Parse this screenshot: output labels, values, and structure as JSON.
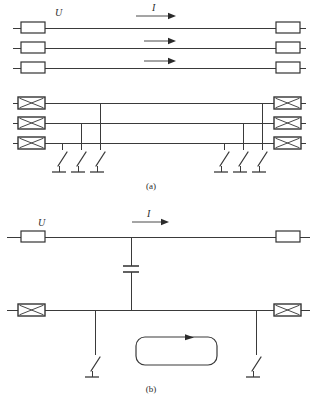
{
  "figure": {
    "labels": {
      "voltage": "U",
      "current": "I"
    },
    "captions": {
      "top": "(a)",
      "bottom": "(b)"
    }
  },
  "panel_a": {
    "caption": "(a)",
    "voltage_label": "U",
    "current_label": "I",
    "upper_section": {
      "description": "three parallel conductors with rectangular terminal boxes at both ends",
      "line_count": 3,
      "current_arrow_count": 3,
      "left_terminal_name": "plain-rectangle-terminal",
      "right_terminal_name": "plain-rectangle-terminal"
    },
    "lower_section": {
      "description": "three parallel buses with crossed-box terminals and earthing switches",
      "line_count": 3,
      "left_terminal_name": "crossed-box-terminal",
      "right_terminal_name": "crossed-box-terminal",
      "left_switch_count": 3,
      "right_switch_count": 3,
      "switch_name": "earthing-switch"
    }
  },
  "panel_b": {
    "caption": "(b)",
    "voltage_label": "U",
    "current_label": "I",
    "upper_line_terminal_name": "plain-rectangle-terminal",
    "lower_line_terminal_name": "crossed-box-terminal",
    "capacitor_name": "capacitor-symbol",
    "loop_name": "current-loop",
    "loop_arrow_direction": "clockwise",
    "switch_count": 2,
    "switch_name": "earthing-switch"
  }
}
